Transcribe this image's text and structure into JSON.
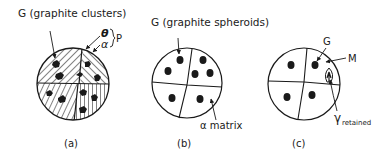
{
  "panels": [
    {
      "id": "a",
      "caption": "(a)",
      "label_graphite": "G (graphite clusters)",
      "label_theta": "θ",
      "label_alpha": "α",
      "label_phase": "P"
    },
    {
      "id": "b",
      "caption": "(b)",
      "label_graphite": "G (graphite spheroids)",
      "label_matrix": "α matrix"
    },
    {
      "id": "c",
      "caption": "(c)",
      "label_graphite": "G",
      "label_martensite": "M",
      "label_gamma": "γ",
      "label_gamma_sub": "retained"
    }
  ],
  "colors": {
    "ink": "#1a1a1a",
    "background": "#ffffff"
  }
}
